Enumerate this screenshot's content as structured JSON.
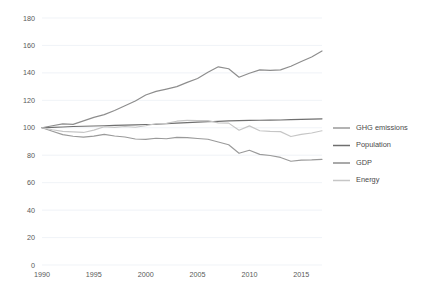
{
  "chart_data": {
    "type": "line",
    "title": "",
    "subtitle": "",
    "xlabel": "",
    "ylabel": "",
    "xlim": [
      1990,
      2017
    ],
    "ylim": [
      0,
      180
    ],
    "ytick_step": 20,
    "yticks": [
      0,
      20,
      40,
      60,
      80,
      100,
      120,
      140,
      160,
      180
    ],
    "xticks": [
      1990,
      1995,
      2000,
      2005,
      2010,
      2015
    ],
    "grid": true,
    "grid_axis": "y",
    "legend_position": "right",
    "index_base": 100,
    "index_base_year": 1990,
    "x": [
      1990,
      1991,
      1992,
      1993,
      1994,
      1995,
      1996,
      1997,
      1998,
      1999,
      2000,
      2001,
      2002,
      2003,
      2004,
      2005,
      2006,
      2007,
      2008,
      2009,
      2010,
      2011,
      2012,
      2013,
      2014,
      2015,
      2016,
      2017
    ],
    "series": [
      {
        "name": "GHG emissions",
        "color": "#9a9a9a",
        "values": [
          100,
          97.5,
          95.0,
          93.8,
          93.2,
          93.9,
          95.2,
          94.0,
          93.3,
          91.8,
          91.5,
          92.4,
          92.0,
          93.0,
          92.8,
          92.2,
          91.6,
          89.6,
          87.6,
          81.4,
          83.6,
          80.6,
          79.8,
          78.4,
          75.6,
          76.4,
          76.6,
          77.0
        ]
      },
      {
        "name": "Population",
        "color": "#6f6f6f",
        "values": [
          100,
          100.3,
          100.6,
          100.9,
          101.1,
          101.3,
          101.5,
          101.7,
          101.9,
          102.1,
          102.4,
          102.6,
          103.0,
          103.4,
          103.8,
          104.1,
          104.4,
          104.7,
          105.0,
          105.2,
          105.4,
          105.5,
          105.6,
          105.7,
          105.9,
          106.1,
          106.3,
          106.5
        ]
      },
      {
        "name": "GDP",
        "color": "#8d8d8d",
        "values": [
          100,
          101.5,
          102.8,
          102.5,
          105.0,
          107.6,
          109.6,
          112.6,
          116.0,
          119.5,
          123.9,
          126.5,
          128.2,
          130.0,
          133.1,
          135.9,
          140.4,
          144.4,
          143.0,
          136.8,
          139.7,
          142.2,
          141.8,
          142.2,
          144.8,
          148.3,
          151.6,
          156.0
        ]
      },
      {
        "name": "Energy",
        "color": "#c6c6c6",
        "values": [
          100,
          98.6,
          97.4,
          97.0,
          96.6,
          98.3,
          100.8,
          100.3,
          100.9,
          100.4,
          101.5,
          103.0,
          103.2,
          104.8,
          105.4,
          105.3,
          105.2,
          103.6,
          103.4,
          98.2,
          101.4,
          97.8,
          97.4,
          97.2,
          93.6,
          95.2,
          96.2,
          97.8
        ]
      }
    ]
  },
  "legend": {
    "entries": [
      {
        "label": "GHG emissions"
      },
      {
        "label": "Population"
      },
      {
        "label": "GDP"
      },
      {
        "label": "Energy"
      }
    ]
  },
  "caption": {
    "text": ""
  }
}
